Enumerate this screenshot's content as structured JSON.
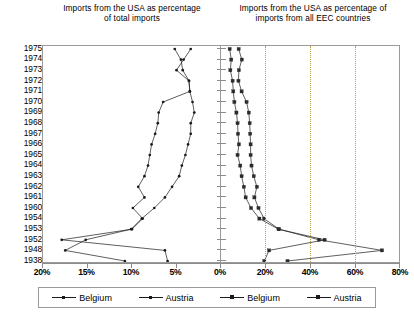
{
  "chart_data": {
    "type": "line",
    "orientation": "horizontal-years-on-y",
    "panels": [
      {
        "id": "left",
        "title": "Imports from the USA as percentage of total imports",
        "xlabel": "",
        "ylabel": "",
        "xlim": [
          20,
          0
        ],
        "reversed_x": true,
        "grid": false,
        "tick_labels": [
          "20%",
          "15%",
          "10%",
          "5%",
          "0%"
        ],
        "tick_values": [
          20,
          15,
          10,
          5,
          0
        ],
        "categories": [
          "1975",
          "1974",
          "1973",
          "1972",
          "1971",
          "1970",
          "1969",
          "1968",
          "1967",
          "1966",
          "1965",
          "1964",
          "1963",
          "1962",
          "1961",
          "1960",
          "1954",
          "1953",
          "1952",
          "1948",
          "1938"
        ],
        "series": [
          {
            "name": "Belgium",
            "marker": "dot",
            "values": [
              5.2,
              4.5,
              4.3,
              3.6,
              3.5,
              3.2,
              3.0,
              3.4,
              3.4,
              3.7,
              4.0,
              4.4,
              4.7,
              5.5,
              6.3,
              7.5,
              8.9,
              10.1,
              15.2,
              17.5,
              10.8
            ]
          },
          {
            "name": "Austria",
            "marker": "dot",
            "values": [
              3.4,
              4.2,
              5.0,
              3.6,
              3.5,
              6.5,
              7.0,
              7.1,
              7.4,
              7.8,
              8.0,
              8.2,
              8.6,
              9.3,
              8.6,
              9.9,
              8.8,
              10.0,
              17.9,
              6.3,
              6.0
            ]
          }
        ]
      },
      {
        "id": "right",
        "title": "Imports from the USA as percentage of imports from all EEC countries",
        "xlabel": "",
        "ylabel": "",
        "xlim": [
          0,
          80
        ],
        "reversed_x": false,
        "grid": true,
        "gridlines": [
          20,
          40,
          60
        ],
        "tick_labels": [
          "0%",
          "20%",
          "40%",
          "60%",
          "80%"
        ],
        "tick_values": [
          0,
          20,
          40,
          60,
          80
        ],
        "categories": [
          "1975",
          "1974",
          "1973",
          "1972",
          "1971",
          "1970",
          "1969",
          "1968",
          "1967",
          "1966",
          "1965",
          "1964",
          "1963",
          "1962",
          "1961",
          "1960",
          "1954",
          "1953",
          "1952",
          "1948",
          "1938"
        ],
        "series": [
          {
            "name": "Belgium",
            "marker": "square",
            "values": [
              4.3,
              5.0,
              4.6,
              5.6,
              5.9,
              6.4,
              7.3,
              7.8,
              8.0,
              8.4,
              7.8,
              9.0,
              9.6,
              10.6,
              11.4,
              13.8,
              17.5,
              26.0,
              46.5,
              21.8,
              19.7
            ]
          },
          {
            "name": "Austria",
            "marker": "square",
            "values": [
              8.3,
              9.7,
              8.4,
              8.2,
              9.6,
              11.8,
              12.8,
              13.2,
              13.4,
              13.6,
              13.6,
              14.0,
              15.0,
              16.4,
              15.3,
              17.1,
              19.6,
              26.2,
              44.0,
              72.0,
              30.0
            ]
          }
        ]
      }
    ]
  },
  "titles": {
    "left": "Imports from the USA as percentage of total imports",
    "right": "Imports from the USA as percentage of imports from all EEC countries"
  },
  "years": [
    "1975",
    "1974",
    "1973",
    "1972",
    "1971",
    "1970",
    "1969",
    "1968",
    "1967",
    "1966",
    "1965",
    "1964",
    "1963",
    "1962",
    "1961",
    "1960",
    "1954",
    "1953",
    "1952",
    "1948",
    "1938"
  ],
  "axis": {
    "left_ticks": [
      "20%",
      "15%",
      "10%",
      "5%",
      "0%"
    ],
    "right_ticks": [
      "0%",
      "20%",
      "40%",
      "60%",
      "80%"
    ]
  },
  "legend": {
    "items": [
      {
        "label": "Belgium",
        "panel": "left",
        "marker": "dot"
      },
      {
        "label": "Austria",
        "panel": "left",
        "marker": "dot"
      },
      {
        "label": "Belgium",
        "panel": "right",
        "marker": "square"
      },
      {
        "label": "Austria",
        "panel": "right",
        "marker": "square"
      }
    ]
  },
  "colors": {
    "line": "#1a1a1a",
    "frame": "#9a9a9a",
    "grid": "#b9a24a",
    "background": "#ffffff"
  }
}
